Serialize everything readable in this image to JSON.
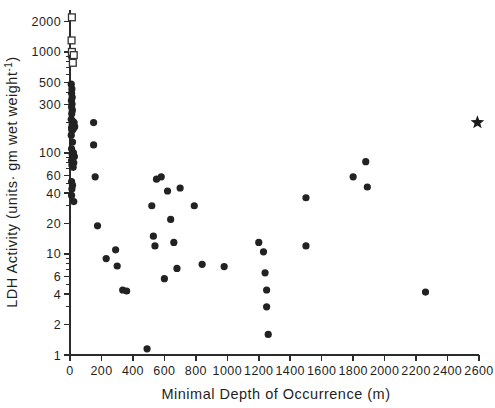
{
  "chart_data": {
    "type": "scatter",
    "title": "",
    "xlabel": "Minimal Depth of Occurrence (m)",
    "ylabel": "LDH Activity (units· gm wet weight⁻¹)",
    "ylabel_parts": {
      "main": "LDH Activity (units· gm wet weight",
      "superscript": "-1",
      "tail": ")"
    },
    "xlim": [
      0,
      2600
    ],
    "ylim": [
      1,
      2600
    ],
    "yscale": "log",
    "xscale": "linear",
    "grid": false,
    "legend": "none",
    "xticks": [
      0,
      200,
      400,
      600,
      800,
      1000,
      1200,
      1400,
      1600,
      1800,
      2000,
      2200,
      2400,
      2600
    ],
    "xticklabels": [
      "0",
      "200",
      "400",
      "600",
      "800",
      "1000",
      "1200",
      "1400",
      "1600",
      "1800",
      "2000",
      "2200",
      "2400",
      "2600"
    ],
    "yticks": [
      1,
      2,
      4,
      6,
      10,
      20,
      40,
      60,
      100,
      300,
      500,
      1000,
      2000
    ],
    "yticklabels": [
      "1",
      "2",
      "4",
      "6",
      "10",
      "20",
      "40",
      "60",
      "100",
      "300",
      "500",
      "1000",
      "2000"
    ],
    "y_minor_ticks": [
      3,
      5,
      7,
      8,
      9,
      30,
      50,
      70,
      80,
      90,
      200,
      400,
      600,
      700,
      800,
      900
    ],
    "series": [
      {
        "name": "filled-circles",
        "marker": "filled-circle",
        "color": "#222222",
        "points": [
          [
            10,
            900
          ],
          [
            8,
            480
          ],
          [
            12,
            430
          ],
          [
            10,
            390
          ],
          [
            14,
            355
          ],
          [
            9,
            330
          ],
          [
            13,
            305
          ],
          [
            10,
            285
          ],
          [
            15,
            265
          ],
          [
            11,
            245
          ],
          [
            8,
            215
          ],
          [
            18,
            205
          ],
          [
            26,
            200
          ],
          [
            14,
            195
          ],
          [
            22,
            188
          ],
          [
            30,
            182
          ],
          [
            10,
            178
          ],
          [
            20,
            172
          ],
          [
            12,
            168
          ],
          [
            8,
            150
          ],
          [
            16,
            128
          ],
          [
            10,
            110
          ],
          [
            22,
            100
          ],
          [
            14,
            96
          ],
          [
            28,
            92
          ],
          [
            18,
            88
          ],
          [
            10,
            84
          ],
          [
            24,
            80
          ],
          [
            12,
            76
          ],
          [
            20,
            72
          ],
          [
            10,
            52
          ],
          [
            16,
            48
          ],
          [
            12,
            44
          ],
          [
            10,
            38
          ],
          [
            24,
            33
          ],
          [
            150,
            200
          ],
          [
            150,
            120
          ],
          [
            160,
            58
          ],
          [
            175,
            19
          ],
          [
            230,
            9
          ],
          [
            290,
            11
          ],
          [
            300,
            7.6
          ],
          [
            335,
            4.4
          ],
          [
            360,
            4.3
          ],
          [
            490,
            1.15
          ],
          [
            520,
            30
          ],
          [
            530,
            15
          ],
          [
            540,
            12
          ],
          [
            550,
            55
          ],
          [
            580,
            58
          ],
          [
            600,
            5.7
          ],
          [
            620,
            42
          ],
          [
            640,
            22
          ],
          [
            660,
            13
          ],
          [
            680,
            7.2
          ],
          [
            700,
            45
          ],
          [
            790,
            30
          ],
          [
            840,
            7.9
          ],
          [
            980,
            7.5
          ],
          [
            1200,
            13
          ],
          [
            1230,
            10.5
          ],
          [
            1240,
            6.5
          ],
          [
            1250,
            4.4
          ],
          [
            1250,
            3.0
          ],
          [
            1260,
            1.6
          ],
          [
            1500,
            36
          ],
          [
            1500,
            12
          ],
          [
            1800,
            58
          ],
          [
            1880,
            82
          ],
          [
            1890,
            46
          ],
          [
            2260,
            4.2
          ]
        ]
      },
      {
        "name": "open-squares",
        "marker": "open-square",
        "color": "#333333",
        "points": [
          [
            12,
            2200
          ],
          [
            10,
            1300
          ],
          [
            12,
            1000
          ],
          [
            24,
            930
          ],
          [
            18,
            780
          ]
        ]
      },
      {
        "name": "star-marker",
        "marker": "star",
        "color": "#1a1a1a",
        "points": [
          [
            2590,
            200
          ]
        ]
      }
    ]
  },
  "figure": {
    "background_color": "#ffffff",
    "axis_color": "#2b2b2b",
    "marker_color": "#222222"
  }
}
